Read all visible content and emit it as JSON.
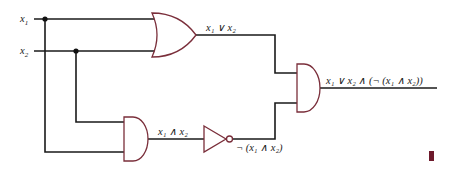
{
  "diagram": {
    "type": "logic-circuit",
    "inputs": [
      {
        "id": "x1",
        "var": "x",
        "sub": "1"
      },
      {
        "id": "x2",
        "var": "x",
        "sub": "2"
      }
    ],
    "gates": [
      {
        "id": "or1",
        "kind": "OR",
        "inputs": [
          "x1",
          "x2"
        ]
      },
      {
        "id": "and1",
        "kind": "AND",
        "inputs": [
          "x1",
          "x2"
        ]
      },
      {
        "id": "not1",
        "kind": "NOT",
        "inputs": [
          "and1"
        ]
      },
      {
        "id": "and2",
        "kind": "AND",
        "inputs": [
          "or1",
          "not1"
        ]
      }
    ],
    "labels": {
      "or_output": "x₁ ∨ x₂",
      "and_output": "x₁ ∧ x₂",
      "not_output": "¬ (x₁ ∧ x₂)",
      "final_output": "x₁ ∨ x₂ ∧ (¬ (x₁ ∧ x₂))"
    },
    "colors": {
      "gate_outline": "#7a2e3a",
      "wire": "#1a1a1a",
      "end_marker": "#6e1a2c"
    }
  }
}
